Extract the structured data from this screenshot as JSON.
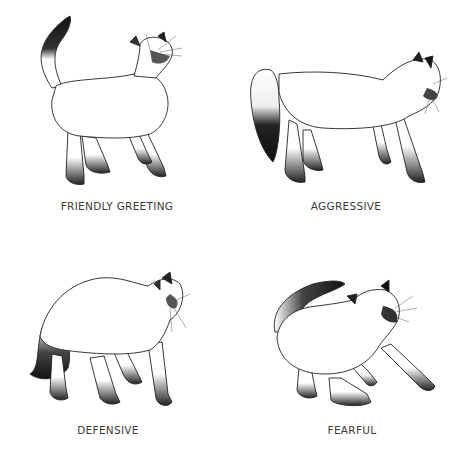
{
  "figure": {
    "background": "#ffffff",
    "ink_color": "#1e1e1e",
    "panels": [
      {
        "id": "friendly-greeting",
        "caption": "FRIENDLY GREETING",
        "icon": "cat-tail-up-icon"
      },
      {
        "id": "aggressive",
        "caption": "AGGRESSIVE",
        "icon": "cat-stalking-icon"
      },
      {
        "id": "defensive",
        "caption": "DEFENSIVE",
        "icon": "cat-arched-back-icon"
      },
      {
        "id": "fearful",
        "caption": "FEARFUL",
        "icon": "cat-crouching-hissing-icon"
      }
    ]
  }
}
